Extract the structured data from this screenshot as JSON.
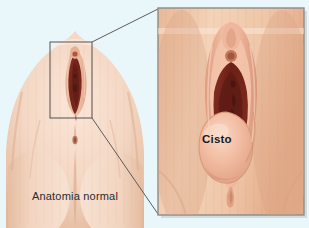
{
  "illustration": {
    "type": "medical-anatomical-diagram",
    "language": "pt-BR",
    "background_color": "#e9f6fa"
  },
  "left_panel": {
    "caption": "Anatomia normal",
    "callout_box": {
      "x": 50,
      "y": 42,
      "width": 42,
      "height": 76,
      "stroke_color": "#54504f"
    }
  },
  "connectors": {
    "stroke_color": "#5d5a59"
  },
  "right_panel": {
    "frame": {
      "x": 158,
      "y": 8,
      "width": 146,
      "height": 207,
      "border_color": "#8a8a8a",
      "background_color": "#edbb9b"
    },
    "label": "Cisto"
  },
  "palette": {
    "skin_light": "#f6dfcf",
    "skin_mid": "#eec5a9",
    "skin_shadow": "#dca888",
    "labia_pink": "#e8a98f",
    "labia_pink_light": "#f2c3ab",
    "interior_dark": "#7e2a20",
    "interior_mid": "#9c3a2a",
    "interior_deep": "#5e1d16",
    "cyst_fill": "#f0b59b",
    "cyst_highlight": "#f8d3c0",
    "text_dark": "#2b2b2b"
  }
}
